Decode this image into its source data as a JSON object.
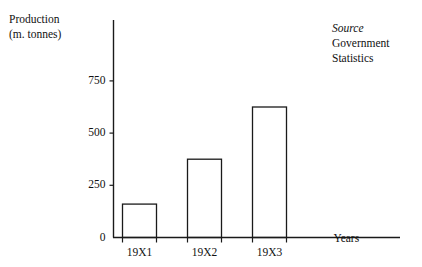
{
  "figure": {
    "background_color": "#ffffff",
    "line_color": "#1a1a1a",
    "y_axis_title_line1": "Production",
    "y_axis_title_line2": "(m. tonnes)",
    "source_heading": "Source",
    "source_line1": "Government",
    "source_line2": "Statistics"
  },
  "chart_data": {
    "type": "bar",
    "title": "",
    "subtitle": "",
    "xlabel": "Years",
    "ylabel": "Production (m. tonnes)",
    "categories": [
      "19X1",
      "19X2",
      "19X3"
    ],
    "values": [
      160,
      375,
      625
    ],
    "ylim": [
      0,
      800
    ],
    "yticks": [
      0,
      250,
      500,
      750
    ],
    "ytick_labels": [
      "0",
      "250",
      "500",
      "750"
    ],
    "grid": false,
    "legend": null,
    "bar_fill": "none",
    "bar_edge_color": "#1a1a1a",
    "annotations": [
      {
        "text": "Source",
        "style": "italic",
        "position": "top-right"
      },
      {
        "text": "Government",
        "style": "normal",
        "position": "top-right"
      },
      {
        "text": "Statistics",
        "style": "normal",
        "position": "top-right"
      }
    ]
  }
}
